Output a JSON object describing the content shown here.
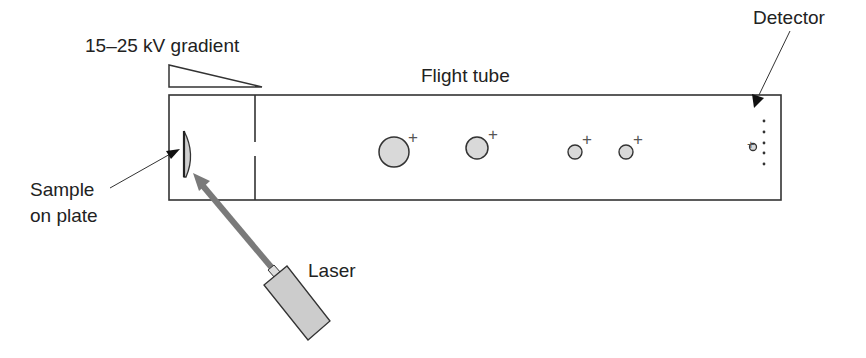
{
  "labels": {
    "gradient": "15–25 kV gradient",
    "flight_tube": "Flight tube",
    "detector": "Detector",
    "sample_line1": "Sample",
    "sample_line2": "on plate",
    "laser": "Laser"
  },
  "ions": [
    {
      "cx": 394,
      "cy": 152,
      "r": 15,
      "charge": "+"
    },
    {
      "cx": 477,
      "cy": 148,
      "r": 11,
      "charge": "+"
    },
    {
      "cx": 575,
      "cy": 152,
      "r": 7,
      "charge": "+"
    },
    {
      "cx": 626,
      "cy": 152,
      "r": 7,
      "charge": "+"
    },
    {
      "cx": 753,
      "cy": 147,
      "r": 3.5,
      "charge": "+"
    }
  ],
  "colors": {
    "stroke": "#333333",
    "ion_fill": "#d9d9d9",
    "laser_beam": "#7a7a7a",
    "laser_body": "#cccccc"
  }
}
